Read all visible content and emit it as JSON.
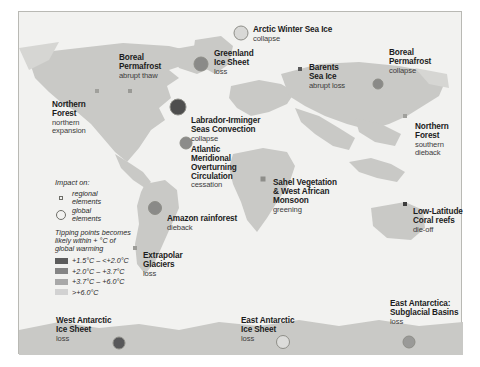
{
  "figure": {
    "background_color": "#ffffff",
    "map_fill_color": "#f2f2f0",
    "land_color": "#c9c9c6",
    "border_color": "#b9b9b4"
  },
  "legend": {
    "impact_heading": "Impact on:",
    "symbols": [
      {
        "icon": "small-square-icon",
        "type": "regional",
        "line1": "regional",
        "line2": "elements"
      },
      {
        "icon": "large-circle-icon",
        "type": "global",
        "line1": "global",
        "line2": "elements"
      }
    ],
    "temperature_heading_line1": "Tipping points becomes",
    "temperature_heading_line2": "likely within + °C of",
    "temperature_heading_line3": "global warming",
    "temperature_bands": [
      {
        "label": "+1.5°C – <+2.0°C",
        "color": "#5c5c5c"
      },
      {
        "label": "+2.0°C – +3.7°C",
        "color": "#858585"
      },
      {
        "label": "+3.7°C – +6.0°C",
        "color": "#a8a8a8"
      },
      {
        "label": ">+6.0°C",
        "color": "#d2d2d2"
      }
    ]
  },
  "tipping_points": [
    {
      "name": "arctic-winter-sea-ice",
      "title": "Arctic Winter Sea Ice",
      "subtitle": "collapse",
      "type": "global",
      "band": ">+6.0°C",
      "color": "#d8d8d6",
      "size": 15,
      "marker": {
        "x": 222,
        "y": 21
      },
      "label": {
        "x": 234,
        "y": 14
      }
    },
    {
      "name": "boreal-permafrost-abrupt-thaw",
      "title": "Boreal\nPermafrost",
      "title_lines": [
        "Boreal",
        "Permafrost"
      ],
      "subtitle": "abrupt thaw",
      "type": "regional",
      "band": "+1.5°C – <+2.0°C",
      "color": "#9a9a96",
      "size": 4,
      "marker": {
        "x": 111,
        "y": 79
      },
      "label": {
        "x": 100,
        "y": 42
      }
    },
    {
      "name": "greenland-ice-sheet",
      "title_lines": [
        "Greenland",
        "Ice Sheet"
      ],
      "subtitle": "loss",
      "type": "global",
      "band": "+2.0°C – +3.7°C",
      "color": "#8a8a88",
      "size": 15,
      "marker": {
        "x": 182,
        "y": 52
      },
      "label": {
        "x": 195,
        "y": 38
      }
    },
    {
      "name": "barents-sea-ice",
      "title_lines": [
        "Barents",
        "Sea Ice"
      ],
      "subtitle": "abrupt loss",
      "type": "regional",
      "band": "+1.5°C – <+2.0°C",
      "color": "#5c5c5c",
      "size": 4,
      "marker": {
        "x": 281,
        "y": 57
      },
      "label": {
        "x": 290,
        "y": 52
      }
    },
    {
      "name": "boreal-permafrost-collapse",
      "title_lines": [
        "Boreal",
        "Permafrost"
      ],
      "subtitle": "collapse",
      "type": "global",
      "band": "+2.0°C – +3.7°C",
      "color": "#8a8a88",
      "size": 11,
      "marker": {
        "x": 359,
        "y": 72
      },
      "label": {
        "x": 370,
        "y": 37
      }
    },
    {
      "name": "northern-forest-northern-expansion",
      "title_lines": [
        "Northern",
        "Forest"
      ],
      "subtitle_lines": [
        "northern",
        "expansion"
      ],
      "type": "regional",
      "band": "+3.7°C – +6.0°C",
      "color": "#a0a09c",
      "size": 4,
      "marker": {
        "x": 78,
        "y": 79
      },
      "label": {
        "x": 33,
        "y": 89
      }
    },
    {
      "name": "labrador-irminger-seas-convection",
      "title_lines": [
        "Labrador-Irminger",
        "Seas Convection"
      ],
      "subtitle": "collapse",
      "type": "global",
      "band": "+1.5°C – <+2.0°C",
      "color": "#4e4e4e",
      "size": 17,
      "marker": {
        "x": 159,
        "y": 95
      },
      "label": {
        "x": 172,
        "y": 105
      }
    },
    {
      "name": "atlantic-meridional-overturning-circulation",
      "title_lines": [
        "Atlantic",
        "Meridional",
        "Overturning",
        "Circulation"
      ],
      "subtitle": "cessation",
      "type": "global",
      "band": "+2.0°C – +3.7°C",
      "color": "#8c8c8a",
      "size": 13,
      "marker": {
        "x": 167,
        "y": 131
      },
      "label": {
        "x": 172,
        "y": 134
      }
    },
    {
      "name": "northern-forest-southern-dieback",
      "title_lines": [
        "Northern",
        "Forest"
      ],
      "subtitle_lines": [
        "southern",
        "dieback"
      ],
      "type": "regional",
      "band": "+3.7°C – +6.0°C",
      "color": "#a0a09c",
      "size": 4,
      "marker": {
        "x": 386,
        "y": 104
      },
      "label": {
        "x": 396,
        "y": 111
      }
    },
    {
      "name": "sahel-vegetation-west-african-monsoon",
      "title_lines": [
        "Sahel Vegetation",
        "& West African",
        "Monsoon"
      ],
      "subtitle": "greening",
      "type": "regional",
      "band": "+2.0°C – +3.7°C",
      "color": "#8e8e8a",
      "size": 5,
      "marker": {
        "x": 244,
        "y": 167
      },
      "label": {
        "x": 254,
        "y": 167
      }
    },
    {
      "name": "amazon-rainforest",
      "title": "Amazon rainforest",
      "subtitle": "dieback",
      "type": "global",
      "band": "+2.0°C – +3.7°C",
      "color": "#8a8a88",
      "size": 14,
      "marker": {
        "x": 136,
        "y": 196
      },
      "label": {
        "x": 148,
        "y": 203
      }
    },
    {
      "name": "low-latitude-coral-reefs",
      "title_lines": [
        "Low-Latitude",
        "Coral reefs"
      ],
      "subtitle": "die-off",
      "type": "regional",
      "band": "+1.5°C – <+2.0°C",
      "color": "#3d3d3d",
      "size": 4,
      "marker": {
        "x": 386,
        "y": 192
      },
      "label": {
        "x": 394,
        "y": 196
      }
    },
    {
      "name": "extrapolar-glaciers",
      "title_lines": [
        "Extrapolar",
        "Glaciers"
      ],
      "subtitle": "loss",
      "type": "regional",
      "band": "+3.7°C – +6.0°C",
      "color": "#9c9c98",
      "size": 4,
      "marker": {
        "x": 116,
        "y": 236
      },
      "label": {
        "x": 124,
        "y": 240
      }
    },
    {
      "name": "west-antarctic-ice-sheet",
      "title_lines": [
        "West Antarctic",
        "Ice Sheet"
      ],
      "subtitle": "loss",
      "type": "global",
      "band": "+1.5°C – <+2.0°C",
      "color": "#58585a",
      "size": 13,
      "marker": {
        "x": 100,
        "y": 331
      },
      "label": {
        "x": 37,
        "y": 305
      }
    },
    {
      "name": "east-antarctic-ice-sheet",
      "title_lines": [
        "East Antarctic",
        "Ice Sheet"
      ],
      "subtitle": "loss",
      "type": "global",
      "band": ">+6.0°C",
      "color": "#dcdcda",
      "size": 14,
      "marker": {
        "x": 264,
        "y": 330
      },
      "label": {
        "x": 222,
        "y": 305
      }
    },
    {
      "name": "east-antarctica-subglacial-basins",
      "title_lines": [
        "East Antarctica:",
        "Subglacial Basins"
      ],
      "subtitle": "loss",
      "type": "global",
      "band": "+3.7°C – +6.0°C",
      "color": "#9a9a98",
      "size": 13,
      "marker": {
        "x": 390,
        "y": 330
      },
      "label": {
        "x": 371,
        "y": 288
      }
    }
  ]
}
